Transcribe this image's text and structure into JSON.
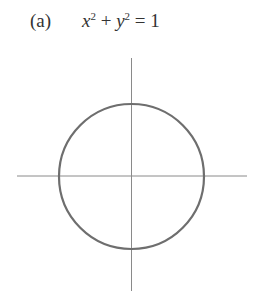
{
  "figure": {
    "label": "(a)",
    "equation": {
      "var1": "x",
      "exp1": "2",
      "op": " + ",
      "var2": "y",
      "exp2": "2",
      "rhs": " = 1"
    }
  },
  "colors": {
    "axis": "#8a8a8a",
    "curve": "#6e6e6e",
    "text": "#333333"
  }
}
